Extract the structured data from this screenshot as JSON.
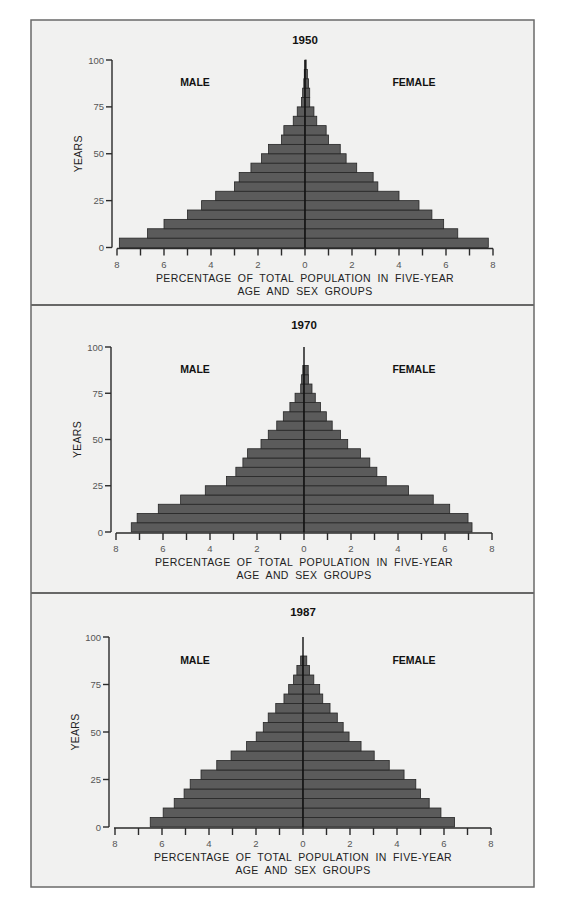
{
  "figure": {
    "background": "#f1f1f0",
    "bar_color": "#5b5b5b",
    "panels": [
      {
        "title": "1950",
        "male_label": "MALE",
        "female_label": "FEMALE",
        "ylabel": "YEARS",
        "xlabel_line1": "PERCENTAGE OF TOTAL POPULATION IN FIVE-YEAR",
        "xlabel_line2": "AGE AND SEX GROUPS"
      },
      {
        "title": "1970",
        "male_label": "MALE",
        "female_label": "FEMALE",
        "ylabel": "YEARS",
        "xlabel_line1": "PERCENTAGE OF TOTAL POPULATION IN FIVE-YEAR",
        "xlabel_line2": "AGE AND SEX GROUPS"
      },
      {
        "title": "1987",
        "male_label": "MALE",
        "female_label": "FEMALE",
        "ylabel": "YEARS",
        "xlabel_line1": "PERCENTAGE OF TOTAL POPULATION IN FIVE-YEAR",
        "xlabel_line2": "AGE AND SEX GROUPS"
      }
    ]
  },
  "chart_data": [
    {
      "type": "bar",
      "subtype": "population-pyramid",
      "title": "1950",
      "xlabel": "PERCENTAGE OF TOTAL POPULATION IN FIVE-YEAR AGE AND SEX GROUPS",
      "ylabel": "YEARS",
      "x_ticks": [
        8,
        7,
        6,
        5,
        4,
        3,
        2,
        1,
        0,
        1,
        2,
        3,
        4,
        5,
        6,
        7,
        8
      ],
      "x_tick_labels": [
        "8",
        "6",
        "4",
        "2",
        "0",
        "2",
        "4",
        "6",
        "8"
      ],
      "y_ticks": [
        0,
        25,
        50,
        75,
        100
      ],
      "xlim": [
        -8,
        8
      ],
      "ylim": [
        0,
        100
      ],
      "grid": false,
      "categories": [
        "0-4",
        "5-9",
        "10-14",
        "15-19",
        "20-24",
        "25-29",
        "30-34",
        "35-39",
        "40-44",
        "45-49",
        "50-54",
        "55-59",
        "60-64",
        "65-69",
        "70-74",
        "75-79",
        "80-84",
        "85-89",
        "90-94",
        "95-99"
      ],
      "series": [
        {
          "name": "MALE",
          "values": [
            7.9,
            6.7,
            6.0,
            5.0,
            4.4,
            3.8,
            3.0,
            2.8,
            2.3,
            1.85,
            1.55,
            1.0,
            0.9,
            0.5,
            0.33,
            0.15,
            0.1,
            0.05,
            0.03,
            0.0
          ]
        },
        {
          "name": "FEMALE",
          "values": [
            7.8,
            6.5,
            5.9,
            5.4,
            4.85,
            4.0,
            3.1,
            2.9,
            2.2,
            1.75,
            1.5,
            1.0,
            0.9,
            0.5,
            0.38,
            0.2,
            0.2,
            0.15,
            0.1,
            0.05
          ]
        }
      ]
    },
    {
      "type": "bar",
      "subtype": "population-pyramid",
      "title": "1970",
      "xlabel": "PERCENTAGE OF TOTAL POPULATION IN FIVE-YEAR AGE AND SEX GROUPS",
      "ylabel": "YEARS",
      "x_tick_labels": [
        "8",
        "6",
        "4",
        "2",
        "0",
        "2",
        "4",
        "6",
        "8"
      ],
      "y_ticks": [
        0,
        25,
        50,
        75,
        100
      ],
      "xlim": [
        -8,
        8
      ],
      "ylim": [
        0,
        100
      ],
      "grid": false,
      "categories": [
        "0-4",
        "5-9",
        "10-14",
        "15-19",
        "20-24",
        "25-29",
        "30-34",
        "35-39",
        "40-44",
        "45-49",
        "50-54",
        "55-59",
        "60-64",
        "65-69",
        "70-74",
        "75-79",
        "80-84",
        "85-89",
        "90-94",
        "95-99"
      ],
      "series": [
        {
          "name": "MALE",
          "values": [
            7.35,
            7.1,
            6.2,
            5.25,
            4.2,
            3.3,
            2.9,
            2.6,
            2.4,
            1.83,
            1.52,
            1.16,
            0.88,
            0.6,
            0.38,
            0.14,
            0.1,
            0.05,
            0.0,
            0.0
          ]
        },
        {
          "name": "FEMALE",
          "values": [
            7.15,
            6.98,
            6.2,
            5.5,
            4.45,
            3.5,
            3.1,
            2.8,
            2.4,
            1.86,
            1.55,
            1.2,
            0.95,
            0.7,
            0.48,
            0.34,
            0.19,
            0.18,
            0.0,
            0.0
          ]
        }
      ]
    },
    {
      "type": "bar",
      "subtype": "population-pyramid",
      "title": "1987",
      "xlabel": "PERCENTAGE OF TOTAL POPULATION IN FIVE-YEAR AGE AND SEX GROUPS",
      "ylabel": "YEARS",
      "x_tick_labels": [
        "8",
        "6",
        "4",
        "2",
        "0",
        "2",
        "4",
        "6",
        "8"
      ],
      "y_ticks": [
        0,
        25,
        50,
        75,
        100
      ],
      "xlim": [
        -8,
        8
      ],
      "ylim": [
        0,
        100
      ],
      "grid": false,
      "categories": [
        "0-4",
        "5-9",
        "10-14",
        "15-19",
        "20-24",
        "25-29",
        "30-34",
        "35-39",
        "40-44",
        "45-49",
        "50-54",
        "55-59",
        "60-64",
        "65-69",
        "70-74",
        "75-79",
        "80-84",
        "85-89",
        "90-94",
        "95-99"
      ],
      "series": [
        {
          "name": "MALE",
          "values": [
            6.5,
            5.95,
            5.48,
            5.06,
            4.8,
            4.34,
            3.67,
            3.06,
            2.4,
            1.99,
            1.69,
            1.48,
            1.16,
            0.81,
            0.61,
            0.4,
            0.26,
            0.1,
            0.0,
            0.0
          ]
        },
        {
          "name": "FEMALE",
          "values": [
            6.45,
            5.87,
            5.37,
            5.0,
            4.8,
            4.3,
            3.67,
            3.03,
            2.47,
            1.96,
            1.71,
            1.46,
            1.15,
            0.84,
            0.71,
            0.46,
            0.28,
            0.16,
            0.0,
            0.0
          ]
        }
      ]
    }
  ],
  "layout": {
    "panels": [
      {
        "top": 20,
        "bottom": 305,
        "cx": 305,
        "axis_x": 112,
        "y100": 60,
        "y0": 247.5,
        "title_y": 44,
        "sex_y": 86,
        "x_left": 117
      },
      {
        "top": 305,
        "bottom": 593,
        "cx": 304,
        "axis_x": 111,
        "y100": 347,
        "y0": 532,
        "title_y": 329,
        "sex_y": 373,
        "x_left": 116
      },
      {
        "top": 593,
        "bottom": 887,
        "cx": 303,
        "axis_x": 109,
        "y100": 637,
        "y0": 827,
        "title_y": 616,
        "sex_y": 664,
        "x_left": 114
      }
    ]
  }
}
